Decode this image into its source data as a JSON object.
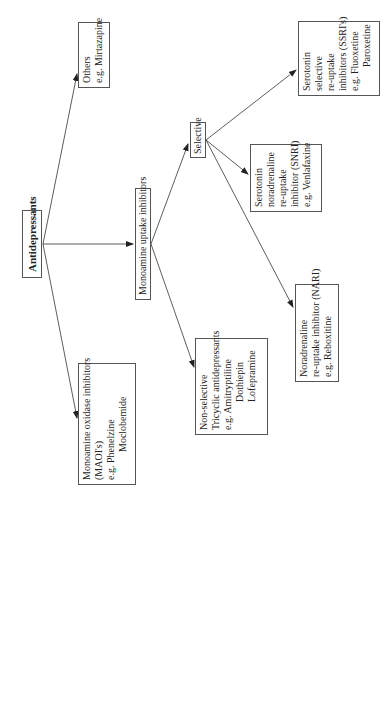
{
  "diagram": {
    "root": {
      "label": "Antidepressants"
    },
    "maoi": {
      "line1": "Monoamine oxidase inhibitors",
      "line2": "(MAOI's)",
      "line3": "e.g. Phenelzine",
      "line4": "Moclobemide"
    },
    "others": {
      "line1": "Others",
      "line2": "e.g. Mirtazapine"
    },
    "uptake": {
      "label": "Monoamine uptake inhibitors"
    },
    "nonselective": {
      "line1": "Non-selective",
      "line2": "Tricyclic antidepressants",
      "line3": "e.g. Amitryptiline",
      "line4": "Dothiepin",
      "line5": "Lofepramine"
    },
    "selective": {
      "label": "Selective"
    },
    "nari": {
      "line1": "Noradrenaline",
      "line2": "re-uptake inhibitor (NARI)",
      "line3": "e.g. Reboxitine"
    },
    "snri": {
      "line1": "Serotonin",
      "line2": "noradrenaline",
      "line3": "re-uptake",
      "line4": "inhibitor (SNRI)",
      "line5": "e.g. Venlafaxine"
    },
    "ssri": {
      "line1": "Serotonin",
      "line2": "selective",
      "line3": "re-uptake",
      "line4": "inhibitors (SSRI's)",
      "line5": "e.g. Fluoxetine",
      "line6": "Paroxetine"
    },
    "colors": {
      "line": "#333333",
      "border": "#555555",
      "background": "#ffffff"
    }
  }
}
